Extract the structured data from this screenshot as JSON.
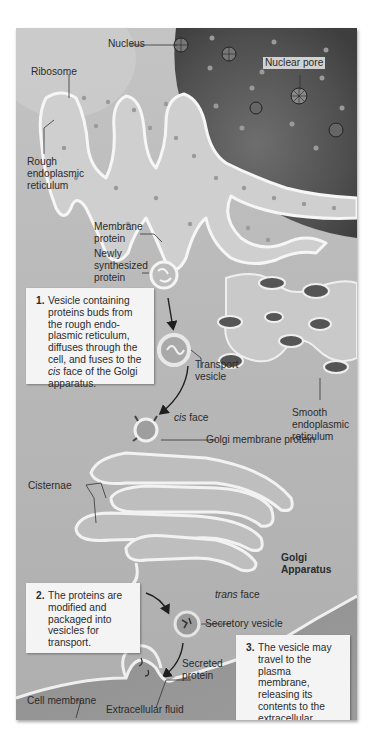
{
  "figure": {
    "colors": {
      "background": "#b9b9b9",
      "nucleus": "#5a5a5a",
      "membrane": "#f0f0f0",
      "callout_bg": "#f4f4f4",
      "text": "#2b2b2b"
    }
  },
  "labels": {
    "nucleus": "Nucleus",
    "ribosome": "Ribosome",
    "nuclear_pore": "Nuclear pore",
    "rough_er": [
      "Rough",
      "endoplasmic",
      "reticulum"
    ],
    "membrane_protein": [
      "Membrane",
      "protein"
    ],
    "newly_synthesized_protein": [
      "Newly",
      "synthesized",
      "protein"
    ],
    "transport_vesicle": [
      "Transport",
      "vesicle"
    ],
    "smooth_er": [
      "Smooth",
      "endoplasmic",
      "reticulum"
    ],
    "cis_face_italic": "cis",
    "cis_face_rest": " face",
    "golgi_membrane_protein": "Golgi membrane protein",
    "cisternae": "Cisternae",
    "golgi_apparatus": [
      "Golgi",
      "Apparatus"
    ],
    "trans_face_italic": "trans",
    "trans_face_rest": " face",
    "secretory_vesicle": "Secretory vesicle",
    "secreted_protein": [
      "Secreted",
      "protein"
    ],
    "cell_membrane": "Cell membrane",
    "extracellular_fluid": "Extracellular fluid"
  },
  "callouts": [
    {
      "number": "1.",
      "lines": [
        "Vesicle containing",
        "proteins buds from",
        "the rough endo-",
        "plasmic reticulum,",
        "diffuses through the",
        "cell, and fuses to the"
      ],
      "line_italic_prefix": "cis",
      "line_italic_rest": " face of the Golgi",
      "last_line": "apparatus."
    },
    {
      "number": "2.",
      "lines": [
        "The proteins are",
        "modified and",
        "packaged into",
        "vesicles for",
        "transport."
      ]
    },
    {
      "number": "3.",
      "lines": [
        "The vesicle may",
        "travel to the",
        "plasma membrane,",
        "releasing its",
        "contents to the",
        "extracellular",
        "environment."
      ]
    }
  ]
}
